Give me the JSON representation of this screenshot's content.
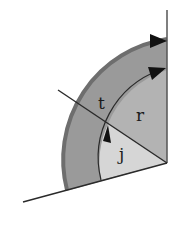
{
  "diagram": {
    "labels": {
      "t": "t",
      "r": "r",
      "j": "j"
    },
    "colors": {
      "background": "#ffffff",
      "outer_band": "#9a9a9a",
      "outer_rim": "#6e6e6e",
      "r_region": "#b3b3b3",
      "j_region": "#d6d6d6",
      "lines": "#2a2a2a",
      "arrows": "#111111"
    }
  }
}
